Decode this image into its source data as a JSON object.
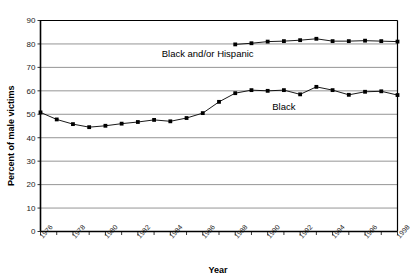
{
  "chart_data": {
    "type": "line",
    "title": "",
    "xlabel": "Year",
    "ylabel": "Percent of male victims",
    "ylim": [
      0,
      90
    ],
    "ytick_step": 10,
    "yticks": [
      0,
      10,
      20,
      30,
      40,
      50,
      60,
      70,
      80,
      90
    ],
    "xlim": [
      1976,
      1998
    ],
    "x": [
      1976,
      1977,
      1978,
      1979,
      1980,
      1981,
      1982,
      1983,
      1984,
      1985,
      1986,
      1987,
      1988,
      1989,
      1990,
      1991,
      1992,
      1993,
      1994,
      1995,
      1996,
      1997,
      1998
    ],
    "xticks_all": [
      1976,
      1977,
      1978,
      1979,
      1980,
      1981,
      1982,
      1983,
      1984,
      1985,
      1986,
      1987,
      1988,
      1989,
      1990,
      1991,
      1992,
      1993,
      1994,
      1995,
      1996,
      1997,
      1998
    ],
    "xtick_labels": [
      "1976",
      "1978",
      "1980",
      "1982",
      "1984",
      "1986",
      "1988",
      "1990",
      "1992",
      "1994",
      "1996",
      "1998"
    ],
    "xtick_label_years": [
      1976,
      1978,
      1980,
      1982,
      1984,
      1986,
      1988,
      1990,
      1992,
      1994,
      1996,
      1998
    ],
    "grid": true,
    "grid_axis": "y",
    "legend_position": "inline-annotation",
    "marker": "square",
    "series": [
      {
        "name": "Black and/or Hispanic",
        "label": "Black and/or Hispanic",
        "color": "#000000",
        "x": [
          1988,
          1989,
          1990,
          1991,
          1992,
          1993,
          1994,
          1995,
          1996,
          1997,
          1998
        ],
        "values": [
          79.8,
          80.3,
          81.0,
          81.2,
          81.6,
          82.2,
          81.2,
          81.2,
          81.4,
          81.2,
          81.0
        ],
        "label_x": 1986.3,
        "label_y": 74.5
      },
      {
        "name": "Black",
        "label": "Black",
        "color": "#000000",
        "x": [
          1976,
          1977,
          1978,
          1979,
          1980,
          1981,
          1982,
          1983,
          1984,
          1985,
          1986,
          1987,
          1988,
          1989,
          1990,
          1991,
          1992,
          1993,
          1994,
          1995,
          1996,
          1997,
          1998
        ],
        "values": [
          50.8,
          47.8,
          45.8,
          44.5,
          45.1,
          46.0,
          46.7,
          47.6,
          47.0,
          48.4,
          50.5,
          55.3,
          59.0,
          60.3,
          60.0,
          60.3,
          58.5,
          61.7,
          60.3,
          58.3,
          59.6,
          59.8,
          58.2
        ],
        "label_x": 1991.0,
        "label_y": 52.0
      }
    ]
  },
  "axis": {
    "x_title": "Year",
    "y_title": "Percent of male victims"
  }
}
